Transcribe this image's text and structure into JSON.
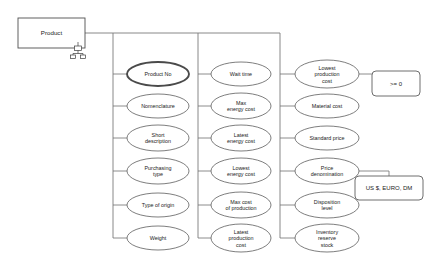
{
  "diagram": {
    "type": "entity-attribute-diagram",
    "entity": {
      "label": "Product",
      "shape": "rectangle",
      "x": 18,
      "y": 18,
      "w": 67,
      "h": 30,
      "icon": "hierarchy-icon"
    },
    "columns": [
      {
        "id": "column-1",
        "trunk_x": 113,
        "attributes": [
          {
            "label": "Product No",
            "lines": [
              "Product No"
            ],
            "key": true,
            "cx": 158,
            "cy": 74,
            "rx": 31,
            "ry": 12
          },
          {
            "label": "Nomenclature",
            "lines": [
              "Nomenclature"
            ],
            "key": false,
            "cx": 158,
            "cy": 106,
            "rx": 31,
            "ry": 12
          },
          {
            "label": "Short description",
            "lines": [
              "Short",
              "description"
            ],
            "key": false,
            "cx": 158,
            "cy": 138,
            "rx": 31,
            "ry": 13
          },
          {
            "label": "Purchasing type",
            "lines": [
              "Purchasing",
              "type"
            ],
            "key": false,
            "cx": 158,
            "cy": 171,
            "rx": 31,
            "ry": 13
          },
          {
            "label": "Type of origin",
            "lines": [
              "Type of origin"
            ],
            "key": false,
            "cx": 158,
            "cy": 205,
            "rx": 31,
            "ry": 12
          },
          {
            "label": "Weight",
            "lines": [
              "Weight"
            ],
            "key": false,
            "cx": 158,
            "cy": 238,
            "rx": 31,
            "ry": 12
          }
        ]
      },
      {
        "id": "column-2",
        "trunk_x": 198,
        "attributes": [
          {
            "label": "Wait time",
            "lines": [
              "Wait time"
            ],
            "key": false,
            "cx": 241,
            "cy": 74,
            "rx": 30,
            "ry": 12
          },
          {
            "label": "Max energy cost",
            "lines": [
              "Max",
              "energy cost"
            ],
            "key": false,
            "cx": 241,
            "cy": 106,
            "rx": 30,
            "ry": 13
          },
          {
            "label": "Latest energy cost",
            "lines": [
              "Latest",
              "energy cost"
            ],
            "key": false,
            "cx": 241,
            "cy": 138,
            "rx": 30,
            "ry": 13
          },
          {
            "label": "Lowest energy cost",
            "lines": [
              "Lowest",
              "energy cost"
            ],
            "key": false,
            "cx": 241,
            "cy": 171,
            "rx": 30,
            "ry": 13
          },
          {
            "label": "Max cost of production",
            "lines": [
              "Max  cost",
              "of production"
            ],
            "key": false,
            "cx": 241,
            "cy": 205,
            "rx": 30,
            "ry": 13
          },
          {
            "label": "Latest production cost",
            "lines": [
              "Latest",
              "production",
              "cost"
            ],
            "key": false,
            "cx": 241,
            "cy": 238,
            "rx": 30,
            "ry": 14
          }
        ]
      },
      {
        "id": "column-3",
        "trunk_x": 280,
        "attributes": [
          {
            "label": "Lowest production cost",
            "lines": [
              "Lowest",
              "production",
              "cost"
            ],
            "key": false,
            "cx": 327,
            "cy": 74,
            "rx": 32,
            "ry": 14
          },
          {
            "label": "Material cost",
            "lines": [
              "Material cost"
            ],
            "key": false,
            "cx": 327,
            "cy": 106,
            "rx": 32,
            "ry": 12
          },
          {
            "label": "Standard price",
            "lines": [
              "Standard price"
            ],
            "key": false,
            "cx": 327,
            "cy": 138,
            "rx": 32,
            "ry": 12
          },
          {
            "label": "Price denomination",
            "lines": [
              "Price",
              "denomination"
            ],
            "key": false,
            "cx": 327,
            "cy": 171,
            "rx": 32,
            "ry": 13
          },
          {
            "label": "Disposition level",
            "lines": [
              "Disposition",
              "level"
            ],
            "key": false,
            "cx": 327,
            "cy": 205,
            "rx": 32,
            "ry": 13
          },
          {
            "label": "Inventory reserve stock",
            "lines": [
              "Inventory",
              "reserve",
              "stock"
            ],
            "key": false,
            "cx": 327,
            "cy": 238,
            "rx": 32,
            "ry": 14
          }
        ]
      }
    ],
    "domains": [
      {
        "id": "domain-nonnegative",
        "label": ">= 0",
        "source": "Lowest production cost",
        "x": 372,
        "y": 71,
        "w": 48,
        "h": 25,
        "from_x": 359,
        "from_y": 74,
        "drop_x": 396
      },
      {
        "id": "domain-currency",
        "label": "US $, EURO, DM",
        "source": "Price denomination",
        "x": 355,
        "y": 176,
        "w": 68,
        "h": 24,
        "from_x": 359,
        "from_y": 171,
        "drop_x": 389
      }
    ],
    "connector": {
      "entity_out_x": 85,
      "entity_out_y": 33,
      "bus_end_x": 280
    }
  }
}
